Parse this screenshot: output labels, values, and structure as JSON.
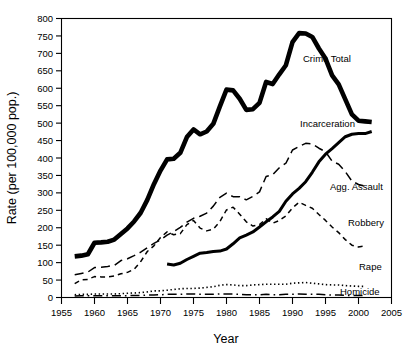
{
  "chart_data": {
    "type": "line",
    "title": "",
    "xlabel": "Year",
    "ylabel": "Rate (per 100,000 pop.)",
    "xlim": [
      1955,
      2005
    ],
    "ylim": [
      0,
      800
    ],
    "xticks": [
      1955,
      1960,
      1965,
      1970,
      1975,
      1980,
      1985,
      1990,
      1995,
      2000,
      2005
    ],
    "yticks": [
      0,
      50,
      100,
      150,
      200,
      250,
      300,
      350,
      400,
      450,
      500,
      550,
      600,
      650,
      700,
      750,
      800
    ],
    "grid": false,
    "legend_position": "inline-right-labels",
    "series": [
      {
        "name": "Crime Total",
        "label": "Crime Total",
        "line_style": "solid-thick",
        "color": "#000000",
        "x": [
          1957,
          1958,
          1959,
          1960,
          1961,
          1962,
          1963,
          1964,
          1965,
          1966,
          1967,
          1968,
          1969,
          1970,
          1971,
          1972,
          1973,
          1974,
          1975,
          1976,
          1977,
          1978,
          1979,
          1980,
          1981,
          1982,
          1983,
          1984,
          1985,
          1986,
          1987,
          1988,
          1989,
          1990,
          1991,
          1992,
          1993,
          1994,
          1995,
          1996,
          1997,
          1998,
          1999,
          2000,
          2001,
          2002
        ],
        "y": [
          118,
          120,
          124,
          157,
          158,
          160,
          166,
          182,
          198,
          218,
          243,
          280,
          325,
          364,
          396,
          398,
          415,
          460,
          482,
          468,
          476,
          498,
          548,
          596,
          594,
          570,
          538,
          540,
          558,
          618,
          612,
          640,
          666,
          732,
          758,
          757,
          747,
          714,
          685,
          637,
          611,
          568,
          525,
          507,
          505,
          503
        ]
      },
      {
        "name": "Incarceration",
        "label": "Incarceration",
        "line_style": "solid-medium",
        "color": "#000000",
        "x": [
          1971,
          1972,
          1973,
          1974,
          1975,
          1976,
          1977,
          1978,
          1979,
          1980,
          1981,
          1982,
          1983,
          1984,
          1985,
          1986,
          1987,
          1988,
          1989,
          1990,
          1991,
          1992,
          1993,
          1994,
          1995,
          1996,
          1997,
          1998,
          1999,
          2000,
          2001,
          2002
        ],
        "y": [
          96,
          93,
          98,
          109,
          118,
          127,
          129,
          132,
          133,
          139,
          154,
          171,
          179,
          188,
          202,
          217,
          231,
          247,
          276,
          297,
          313,
          332,
          359,
          389,
          411,
          427,
          444,
          461,
          468,
          470,
          470,
          476
        ]
      },
      {
        "name": "Agg. Assault",
        "label": "Agg. Assault",
        "line_style": "long-dash",
        "color": "#000000",
        "x": [
          1957,
          1958,
          1959,
          1960,
          1961,
          1962,
          1963,
          1964,
          1965,
          1966,
          1967,
          1968,
          1969,
          1970,
          1971,
          1972,
          1973,
          1974,
          1975,
          1976,
          1977,
          1978,
          1979,
          1980,
          1981,
          1982,
          1983,
          1984,
          1985,
          1986,
          1987,
          1988,
          1989,
          1990,
          1991,
          1992,
          1993,
          1994,
          1995,
          1996,
          1997,
          1998,
          1999,
          2000,
          2001
        ],
        "y": [
          65,
          69,
          73,
          86,
          87,
          89,
          92,
          106,
          111,
          120,
          130,
          143,
          155,
          165,
          179,
          189,
          201,
          216,
          227,
          233,
          242,
          262,
          287,
          299,
          289,
          289,
          280,
          290,
          303,
          347,
          352,
          372,
          385,
          423,
          433,
          442,
          440,
          428,
          418,
          391,
          382,
          361,
          334,
          324,
          319
        ]
      },
      {
        "name": "Robbery",
        "label": "Robbery",
        "line_style": "short-dash",
        "color": "#000000",
        "x": [
          1957,
          1958,
          1959,
          1960,
          1961,
          1962,
          1963,
          1964,
          1965,
          1966,
          1967,
          1968,
          1969,
          1970,
          1971,
          1972,
          1973,
          1974,
          1975,
          1976,
          1977,
          1978,
          1979,
          1980,
          1981,
          1982,
          1983,
          1984,
          1985,
          1986,
          1987,
          1988,
          1989,
          1990,
          1991,
          1992,
          1993,
          1994,
          1995,
          1996,
          1997,
          1998,
          1999,
          2000,
          2001
        ],
        "y": [
          40,
          51,
          52,
          60,
          59,
          59,
          62,
          68,
          72,
          81,
          103,
          132,
          148,
          172,
          188,
          180,
          183,
          209,
          221,
          199,
          191,
          196,
          218,
          251,
          259,
          239,
          217,
          205,
          209,
          226,
          213,
          221,
          234,
          257,
          273,
          264,
          256,
          238,
          221,
          202,
          186,
          166,
          150,
          145,
          148
        ]
      },
      {
        "name": "Rape",
        "label": "Rape",
        "line_style": "dotted",
        "color": "#000000",
        "x": [
          1957,
          1958,
          1959,
          1960,
          1961,
          1962,
          1963,
          1964,
          1965,
          1966,
          1967,
          1968,
          1969,
          1970,
          1971,
          1972,
          1973,
          1974,
          1975,
          1976,
          1977,
          1978,
          1979,
          1980,
          1981,
          1982,
          1983,
          1984,
          1985,
          1986,
          1987,
          1988,
          1989,
          1990,
          1991,
          1992,
          1993,
          1994,
          1995,
          1996,
          1997,
          1998,
          1999,
          2000,
          2001
        ],
        "y": [
          8,
          9,
          9,
          10,
          10,
          10,
          10,
          11,
          12,
          13,
          14,
          16,
          19,
          19,
          21,
          23,
          25,
          26,
          26,
          27,
          29,
          31,
          35,
          37,
          36,
          34,
          34,
          36,
          37,
          38,
          38,
          38,
          38,
          41,
          42,
          43,
          41,
          39,
          37,
          36,
          36,
          34,
          33,
          32,
          32
        ]
      },
      {
        "name": "Homicide",
        "label": "Homicide",
        "line_style": "dash-dot",
        "color": "#000000",
        "x": [
          1957,
          1958,
          1959,
          1960,
          1961,
          1962,
          1963,
          1964,
          1965,
          1966,
          1967,
          1968,
          1969,
          1970,
          1971,
          1972,
          1973,
          1974,
          1975,
          1976,
          1977,
          1978,
          1979,
          1980,
          1981,
          1982,
          1983,
          1984,
          1985,
          1986,
          1987,
          1988,
          1989,
          1990,
          1991,
          1992,
          1993,
          1994,
          1995,
          1996,
          1997,
          1998,
          1999,
          2000,
          2001
        ],
        "y": [
          4,
          5,
          5,
          5,
          5,
          5,
          5,
          5,
          5,
          6,
          6,
          7,
          7,
          8,
          9,
          9,
          9,
          10,
          10,
          9,
          9,
          9,
          10,
          10,
          10,
          9,
          8,
          8,
          8,
          9,
          8,
          8,
          9,
          9,
          10,
          9,
          9,
          9,
          8,
          7,
          7,
          6,
          6,
          6,
          6
        ]
      }
    ]
  },
  "axes": {
    "y_title": "Rate (per 100,000 pop.)",
    "x_title": "Year",
    "y_tick_labels": [
      "800",
      "750",
      "700",
      "650",
      "600",
      "550",
      "500",
      "450",
      "400",
      "350",
      "300",
      "250",
      "200",
      "150",
      "100",
      "50",
      "0"
    ],
    "x_tick_labels": [
      "1955",
      "1960",
      "1965",
      "1970",
      "1975",
      "1980",
      "1985",
      "1990",
      "1995",
      "2000",
      "2005"
    ]
  },
  "labels": {
    "crime_total": "Crime Total",
    "incarceration": "Incarceration",
    "agg_assault": "Agg. Assault",
    "robbery": "Robbery",
    "rape": "Rape",
    "homicide": "Homicide"
  },
  "colors": {
    "line": "#000000",
    "background": "#ffffff",
    "frame": "#000000"
  }
}
